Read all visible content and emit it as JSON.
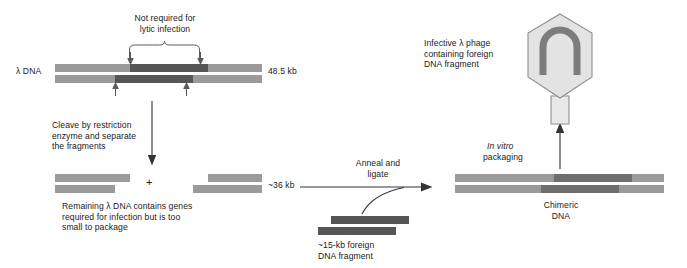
{
  "labels": {
    "not_required": "Not required for\nlytic infection",
    "lambda_dna": "λ DNA",
    "size_full": "48.5 kb",
    "cleave": "Cleave by restriction\nenzyme and separate\nthe fragments",
    "plus": "+",
    "size_arms": "~36 kb",
    "remaining": "Remaining λ DNA contains genes\nrequired for infection but is too\nsmall to package",
    "anneal": "Anneal and\nligate",
    "foreign": "~15-kb foreign\nDNA fragment",
    "in_vitro_italic": "In vitro",
    "packaging": "packaging",
    "chimeric": "Chimeric\nDNA",
    "infective": "Infective λ phage\ncontaining foreign\nDNA fragment"
  },
  "icons": {
    "phage": "bacteriophage-icon",
    "dna_loop": "circular-dna-icon",
    "brace": "curly-brace-icon",
    "cut_arrow": "cut-site-arrow-icon",
    "flow_arrow": "process-arrow-icon"
  },
  "colors": {
    "light_gray_dna": "#9a9a9a",
    "dark_gray_dna": "#565656",
    "mid_gray_dna": "#6e6e6e",
    "phage_capsid": "#e3e3e3",
    "phage_outline": "#8f8f8f",
    "dna_loop": "#7d7d7d",
    "text": "#1a1a1a",
    "background": "#ffffff"
  },
  "diagram_data": {
    "type": "process-flow",
    "steps": [
      {
        "id": "lambda-dna",
        "label": "λ DNA",
        "size": "48.5 kb",
        "note": "middle region not required for lytic infection"
      },
      {
        "id": "cleave",
        "label": "Cleave by restriction enzyme and separate the fragments"
      },
      {
        "id": "arms",
        "label": "Remaining λ DNA arms",
        "size": "~36 kb",
        "note": "too small to package"
      },
      {
        "id": "insert",
        "label": "foreign DNA fragment",
        "size": "~15-kb"
      },
      {
        "id": "ligate",
        "label": "Anneal and ligate"
      },
      {
        "id": "chimeric",
        "label": "Chimeric DNA"
      },
      {
        "id": "package",
        "label": "In vitro packaging"
      },
      {
        "id": "phage",
        "label": "Infective λ phage containing foreign DNA fragment"
      }
    ]
  }
}
